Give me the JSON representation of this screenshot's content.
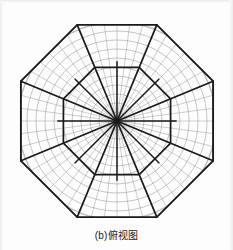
{
  "figure": {
    "caption": "(b)俯视图",
    "colors": {
      "outline": "#1a1a1a",
      "grid": "#8d8d8d",
      "grid_light": "#b0b0b0",
      "background": "#fdfdfd"
    },
    "geometry": {
      "center_x": 117,
      "center_y": 121,
      "outer_octagon_radius": 104,
      "inner_octagon_radius": 58,
      "outer_sides": 8,
      "inner_sides": 8,
      "radial_spokes": 16,
      "grid_circles": 11,
      "grid_radials": 48,
      "grid_circle_radius": 99,
      "rotation_deg": 22.5
    },
    "labels": {
      "view_type": "top-view",
      "part_index": "(b)"
    }
  }
}
